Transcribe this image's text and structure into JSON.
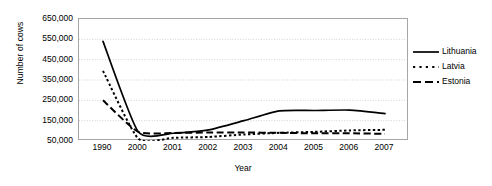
{
  "chart_data": {
    "type": "line",
    "title": "",
    "xlabel": "Year",
    "ylabel": "Number of cows",
    "categories": [
      "1990",
      "2000",
      "2001",
      "2002",
      "2003",
      "2004",
      "2005",
      "2006",
      "2007"
    ],
    "ylim": [
      50000,
      650000
    ],
    "yticks": [
      50000,
      150000,
      250000,
      350000,
      450000,
      550000,
      650000
    ],
    "ytick_labels": [
      "50,000",
      "150,000",
      "250,000",
      "350,000",
      "450,000",
      "550,000",
      "650,000"
    ],
    "grid": "horizontal-dotted",
    "legend_position": "right",
    "series": [
      {
        "name": "Lithuania",
        "style": "solid",
        "color": "#000000",
        "values": [
          540000,
          95000,
          88000,
          105000,
          150000,
          198000,
          200000,
          202000,
          185000
        ]
      },
      {
        "name": "Latvia",
        "style": "dotted",
        "color": "#000000",
        "values": [
          395000,
          62000,
          66000,
          70000,
          82000,
          90000,
          95000,
          102000,
          105000
        ]
      },
      {
        "name": "Estonia",
        "style": "dashed",
        "color": "#000000",
        "values": [
          250000,
          95000,
          90000,
          92000,
          92000,
          90000,
          88000,
          88000,
          85000
        ]
      }
    ]
  },
  "axes": {
    "y_title": "Number of cows",
    "x_title": "Year"
  },
  "legend": {
    "items": [
      {
        "label": "Lithuania",
        "style": "solid"
      },
      {
        "label": "Latvia",
        "style": "dotted"
      },
      {
        "label": "Estonia",
        "style": "dashed"
      }
    ]
  },
  "style": {
    "axis_color": "#a6a6a6",
    "grid_color": "#bfbfbf",
    "line_color": "#000000",
    "background": "#ffffff"
  }
}
